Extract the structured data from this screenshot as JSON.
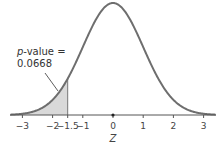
{
  "chart_data": {
    "type": "area",
    "title": "",
    "xlabel": "Z",
    "ylabel": "",
    "xlim": [
      -3.4,
      3.4
    ],
    "x_ticks": [
      -3,
      -2,
      -1.5,
      -1,
      0,
      1,
      2,
      3
    ],
    "x_tick_labels": [
      "−3",
      "−2",
      "−1.5",
      "−1",
      "0",
      "1",
      "2",
      "3"
    ],
    "curve": "standard normal density",
    "shaded_region": {
      "from": "-inf",
      "to": -1.5,
      "area": 0.0668
    },
    "annotation": {
      "line1": "p-value =",
      "line1_italic": "p",
      "line1_rest": "-value =",
      "line2": "0.0668"
    },
    "grid": false,
    "colors": {
      "curve": "#6e6e6e",
      "shade": "#d9d9d9",
      "axis": "#555555"
    }
  }
}
